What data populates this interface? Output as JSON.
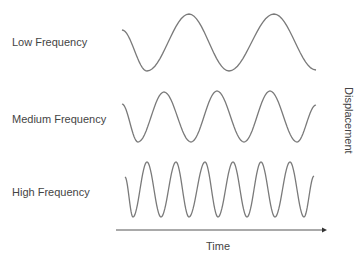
{
  "diagram": {
    "type": "waveform-comparison",
    "rows": [
      {
        "label": "Low Frequency",
        "cycles": 2,
        "points": [
          [
            122,
            30
          ],
          [
            147,
            71
          ],
          [
            189,
            14
          ],
          [
            229,
            71
          ],
          [
            274,
            14
          ],
          [
            316,
            70
          ]
        ]
      },
      {
        "label": "Medium Frequency",
        "cycles": 3.5,
        "points": [
          [
            122,
            104
          ],
          [
            138,
            142
          ],
          [
            164,
            92
          ],
          [
            191,
            142
          ],
          [
            217,
            91
          ],
          [
            244,
            142
          ],
          [
            270,
            91
          ],
          [
            297,
            142
          ],
          [
            316,
            105
          ]
        ]
      },
      {
        "label": "High Frequency",
        "cycles": 6.5,
        "points": [
          [
            125,
            177
          ],
          [
            133,
            217
          ],
          [
            147,
            162
          ],
          [
            161,
            217
          ],
          [
            176,
            162
          ],
          [
            189,
            217
          ],
          [
            205,
            162
          ],
          [
            218,
            217
          ],
          [
            233,
            162
          ],
          [
            247,
            217
          ],
          [
            261,
            162
          ],
          [
            275,
            217
          ],
          [
            290,
            162
          ],
          [
            304,
            217
          ],
          [
            314,
            176
          ]
        ]
      }
    ],
    "x_axis": {
      "label": "Time",
      "start": [
        116,
        230
      ],
      "end": [
        326,
        230
      ],
      "arrow": "right"
    },
    "y_axis": {
      "label": "Displacement",
      "orientation": "vertical"
    },
    "colors": {
      "wave": "#7a7a7a",
      "axis": "#555555",
      "text": "#444444",
      "background": "#ffffff"
    }
  }
}
